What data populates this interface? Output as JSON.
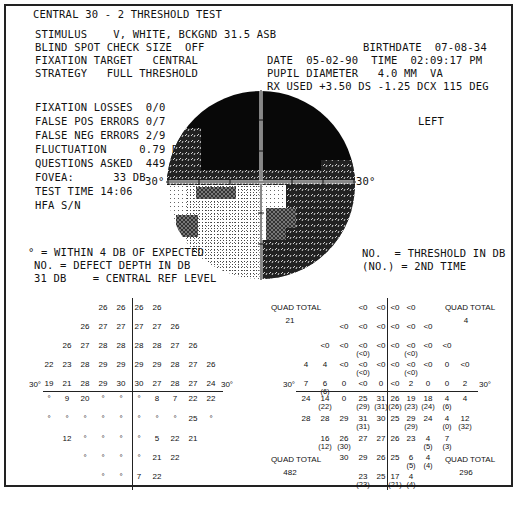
{
  "title": "CENTRAL 30 - 2 THRESHOLD TEST",
  "header_left": [
    "STIMULUS    V, WHITE, BCKGND 31.5 ASB",
    "BLIND SPOT CHECK SIZE  OFF",
    "FIXATION TARGET   CENTRAL",
    "STRATEGY   FULL THRESHOLD"
  ],
  "header_right": {
    "birthdate": "BIRTHDATE  07-08-34",
    "date_time": "DATE  05-02-90  TIME  02:09:17 PM",
    "pupil": "PUPIL DIAMETER   4.0 MM  VA",
    "rx": "RX USED +3.50 DS -1.25 DCX 115 DEG"
  },
  "reliability": [
    "FIXATION LOSSES  0/0",
    "FALSE POS ERRORS 0/7",
    "FALSE NEG ERRORS 2/9",
    "FLUCTUATION     0.79 DB",
    "QUESTIONS ASKED  449",
    "FOVEA:      33 DB",
    "TEST TIME 14:06",
    "HFA S/N"
  ],
  "eye": "LEFT",
  "field_labels": {
    "left_30": "30°",
    "right_30": "30°"
  },
  "legend_left": [
    "° = WITHIN 4 DB OF EXPECTED",
    "NO. = DEFECT DEPTH IN DB",
    "31 DB    = CENTRAL REF LEVEL"
  ],
  "legend_right": [
    "NO.  = THRESHOLD IN DB",
    "(NO.) = 2ND TIME"
  ],
  "defect_grid": {
    "axis_label_left": "30°",
    "axis_label_right": "30°",
    "rows": [
      [
        "",
        "",
        "",
        "26",
        "26",
        "26",
        "26",
        "",
        "",
        ""
      ],
      [
        "",
        "",
        "26",
        "27",
        "27",
        "27",
        "27",
        "26",
        "",
        ""
      ],
      [
        "",
        "26",
        "27",
        "28",
        "28",
        "28",
        "28",
        "27",
        "26",
        ""
      ],
      [
        "22",
        "23",
        "28",
        "29",
        "29",
        "29",
        "29",
        "28",
        "27",
        "26"
      ],
      [
        "19",
        "21",
        "28",
        "29",
        "30",
        "30",
        "27",
        "28",
        "27",
        "24"
      ],
      [
        "°",
        "9",
        "20",
        "°",
        "°",
        "°",
        "8",
        "7",
        "22",
        "22"
      ],
      [
        "°",
        "°",
        "°",
        "°",
        "°",
        "°",
        "°",
        "°",
        "25",
        "°"
      ],
      [
        "",
        "12",
        "°",
        "°",
        "°",
        "°",
        "5",
        "22",
        "21",
        ""
      ],
      [
        "",
        "",
        "°",
        "°",
        "°",
        "°",
        "21",
        "22",
        "",
        ""
      ],
      [
        "",
        "",
        "",
        "°",
        "°",
        "7",
        "22",
        "",
        "",
        ""
      ]
    ]
  },
  "threshold_grid": {
    "quad_total_label": "QUAD TOTAL",
    "quad_totals": {
      "upper_left": "21",
      "upper_right": "4",
      "lower_left": "482",
      "lower_right": "296"
    },
    "axis_label_left": "30°",
    "axis_label_right": "30°",
    "rows": [
      [
        [
          "",
          ""
        ],
        [
          "",
          ""
        ],
        [
          "",
          ""
        ],
        [
          "<0",
          ""
        ],
        [
          "<0",
          ""
        ],
        [
          "<0",
          ""
        ],
        [
          "<0",
          ""
        ],
        [
          "",
          ""
        ],
        [
          "",
          ""
        ],
        [
          "",
          ""
        ]
      ],
      [
        [
          "",
          ""
        ],
        [
          "",
          ""
        ],
        [
          "<0",
          ""
        ],
        [
          "<0",
          ""
        ],
        [
          "<0",
          ""
        ],
        [
          "<0",
          ""
        ],
        [
          "<0",
          ""
        ],
        [
          "<0",
          ""
        ],
        [
          "",
          ""
        ],
        [
          "",
          ""
        ]
      ],
      [
        [
          "",
          ""
        ],
        [
          "<0",
          ""
        ],
        [
          "<0",
          ""
        ],
        [
          "<0",
          "(<0)"
        ],
        [
          "<0",
          ""
        ],
        [
          "<0",
          ""
        ],
        [
          "<0",
          "(<0)"
        ],
        [
          "<0",
          ""
        ],
        [
          "<0",
          ""
        ],
        [
          "",
          ""
        ]
      ],
      [
        [
          "4",
          ""
        ],
        [
          "4",
          ""
        ],
        [
          "<0",
          ""
        ],
        [
          "<0",
          "(<0)"
        ],
        [
          "<0",
          ""
        ],
        [
          "<0",
          ""
        ],
        [
          "<0",
          "(<0)"
        ],
        [
          "<0",
          ""
        ],
        [
          "0",
          ""
        ],
        [
          "<0",
          ""
        ]
      ],
      [
        [
          "7",
          ""
        ],
        [
          "6",
          "(6)"
        ],
        [
          "0",
          ""
        ],
        [
          "<0",
          ""
        ],
        [
          "0",
          ""
        ],
        [
          "<0",
          ""
        ],
        [
          "2",
          ""
        ],
        [
          "0",
          ""
        ],
        [
          "0",
          ""
        ],
        [
          "2",
          ""
        ]
      ],
      [
        [
          "24",
          ""
        ],
        [
          "14",
          "(22)"
        ],
        [
          "0",
          ""
        ],
        [
          "25",
          "(29)"
        ],
        [
          "31",
          "(31)"
        ],
        [
          "26",
          "(26)"
        ],
        [
          "19",
          "(23)"
        ],
        [
          "18",
          "(24)"
        ],
        [
          "4",
          "(6)"
        ],
        [
          "4",
          ""
        ]
      ],
      [
        [
          "28",
          ""
        ],
        [
          "28",
          ""
        ],
        [
          "29",
          ""
        ],
        [
          "31",
          "(31)"
        ],
        [
          "30",
          ""
        ],
        [
          "25",
          ""
        ],
        [
          "29",
          "(29)"
        ],
        [
          "24",
          ""
        ],
        [
          "4",
          "(0)"
        ],
        [
          "12",
          "(32)"
        ]
      ],
      [
        [
          "",
          ""
        ],
        [
          "16",
          "(12)"
        ],
        [
          "26",
          "(30)"
        ],
        [
          "27",
          ""
        ],
        [
          "27",
          ""
        ],
        [
          "26",
          ""
        ],
        [
          "23",
          ""
        ],
        [
          "4",
          "(5)"
        ],
        [
          "7",
          "(3)"
        ],
        [
          "",
          ""
        ]
      ],
      [
        [
          "",
          ""
        ],
        [
          "",
          ""
        ],
        [
          "30",
          ""
        ],
        [
          "29",
          ""
        ],
        [
          "26",
          ""
        ],
        [
          "25",
          ""
        ],
        [
          "6",
          "(5)"
        ],
        [
          "4",
          "(4)"
        ],
        [
          "",
          ""
        ],
        [
          "",
          ""
        ]
      ],
      [
        [
          "",
          ""
        ],
        [
          "",
          ""
        ],
        [
          "",
          ""
        ],
        [
          "23",
          "(23)"
        ],
        [
          "25",
          ""
        ],
        [
          "17",
          "(21)"
        ],
        [
          "4",
          "(4)"
        ],
        [
          "",
          ""
        ],
        [
          "",
          ""
        ],
        [
          "",
          ""
        ]
      ]
    ]
  },
  "colors": {
    "ink": "#111111",
    "paper": "#ffffff",
    "frame": "#222222"
  }
}
